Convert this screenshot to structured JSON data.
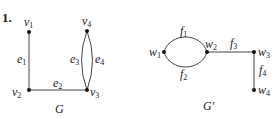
{
  "problem_number": "1.",
  "graphs": [
    {
      "name": "G",
      "vertices": [
        {
          "id": "v1",
          "base": "v",
          "sub": "1"
        },
        {
          "id": "v2",
          "base": "v",
          "sub": "2"
        },
        {
          "id": "v3",
          "base": "v",
          "sub": "3"
        },
        {
          "id": "v4",
          "base": "v",
          "sub": "4"
        }
      ],
      "edges": [
        {
          "id": "e1",
          "base": "e",
          "sub": "1",
          "from": "v1",
          "to": "v2"
        },
        {
          "id": "e2",
          "base": "e",
          "sub": "2",
          "from": "v2",
          "to": "v3"
        },
        {
          "id": "e3",
          "base": "e",
          "sub": "3",
          "from": "v3",
          "to": "v4"
        },
        {
          "id": "e4",
          "base": "e",
          "sub": "4",
          "from": "v3",
          "to": "v4"
        }
      ]
    },
    {
      "name": "G′",
      "vertices": [
        {
          "id": "w1",
          "base": "w",
          "sub": "1"
        },
        {
          "id": "w2",
          "base": "w",
          "sub": "2"
        },
        {
          "id": "w3",
          "base": "w",
          "sub": "3"
        },
        {
          "id": "w4",
          "base": "w",
          "sub": "4"
        }
      ],
      "edges": [
        {
          "id": "f1",
          "base": "f",
          "sub": "1",
          "from": "w1",
          "to": "w2"
        },
        {
          "id": "f2",
          "base": "f",
          "sub": "2",
          "from": "w1",
          "to": "w2"
        },
        {
          "id": "f3",
          "base": "f",
          "sub": "3",
          "from": "w2",
          "to": "w3"
        },
        {
          "id": "f4",
          "base": "f",
          "sub": "4",
          "from": "w3",
          "to": "w4"
        }
      ]
    }
  ]
}
